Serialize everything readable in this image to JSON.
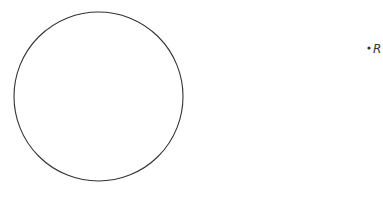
{
  "diagram": {
    "circle": {
      "cx": 98.5,
      "cy": 96.5,
      "r": 84.5,
      "stroke": "#333333",
      "fill": "none"
    },
    "point": {
      "label": "R",
      "x": 369,
      "y": 48,
      "color": "#333333"
    }
  }
}
